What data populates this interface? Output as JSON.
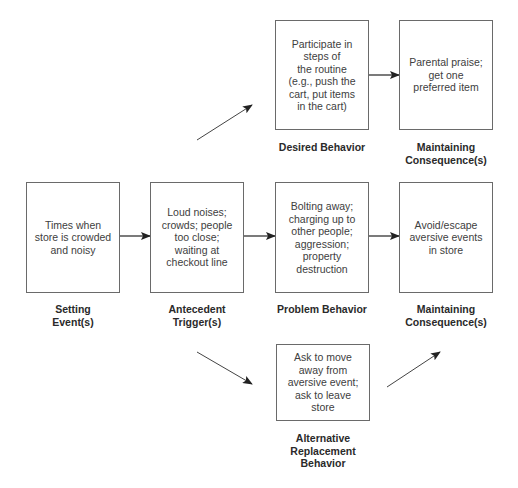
{
  "diagram": {
    "boxes": {
      "setting_event": "Times when\nstore is crowded\nand noisy",
      "antecedent_trigger": "Loud noises;\ncrowds; people\ntoo close;\nwaiting at\ncheckout line",
      "problem_behavior": "Bolting away;\ncharging up to\nother people;\naggression;\nproperty\ndestruction",
      "maintaining_consequence": "Avoid/escape\naversive events\nin store",
      "desired_behavior": "Participate in\nsteps of\nthe routine\n(e.g., push the\ncart, put items\nin the cart)",
      "desired_consequence": "Parental praise;\nget one\npreferred item",
      "replacement_behavior": "Ask to move\naway from\naversive event;\nask to leave\nstore"
    },
    "labels": {
      "setting_event": "Setting\nEvent(s)",
      "antecedent_trigger": "Antecedent\nTrigger(s)",
      "problem_behavior": "Problem Behavior",
      "maintaining_consequence": "Maintaining\nConsequence(s)",
      "desired_behavior": "Desired Behavior",
      "desired_consequence": "Maintaining\nConsequence(s)",
      "replacement_behavior": "Alternative\nReplacement\nBehavior"
    },
    "colors": {
      "line": "#333333",
      "box_border": "#6a6a6a"
    }
  }
}
